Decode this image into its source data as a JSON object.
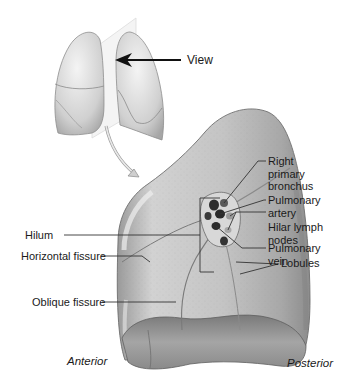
{
  "figure": {
    "orientation_inset": {
      "view_label": "View"
    },
    "labels_right": [
      {
        "id": "right-primary-bronchus",
        "lines": [
          "Right",
          "primary",
          "bronchus"
        ]
      },
      {
        "id": "pulmonary-artery",
        "lines": [
          "Pulmonary",
          "artery"
        ]
      },
      {
        "id": "hilar-lymph-nodes",
        "lines": [
          "Hilar lymph",
          "nodes"
        ]
      },
      {
        "id": "pulmonary-vein",
        "lines": [
          "Pulmonary",
          "vein"
        ]
      },
      {
        "id": "lobules",
        "lines": [
          "Lobules"
        ]
      }
    ],
    "labels_left": [
      {
        "id": "hilum",
        "text": "Hilum"
      },
      {
        "id": "horizontal-fissure",
        "text": "Horizontal fissure"
      },
      {
        "id": "oblique-fissure",
        "text": "Oblique fissure"
      }
    ],
    "orientation_labels": {
      "anterior": "Anterior",
      "posterior": "Posterior"
    },
    "colors": {
      "lung_fill": "#bdbdbd",
      "lung_highlight": "#e6e6e6",
      "lung_shadow": "#8a8a8a",
      "vessel_dark": "#2e2e2e",
      "leader_line": "#333333",
      "text": "#1a1a1a"
    }
  }
}
